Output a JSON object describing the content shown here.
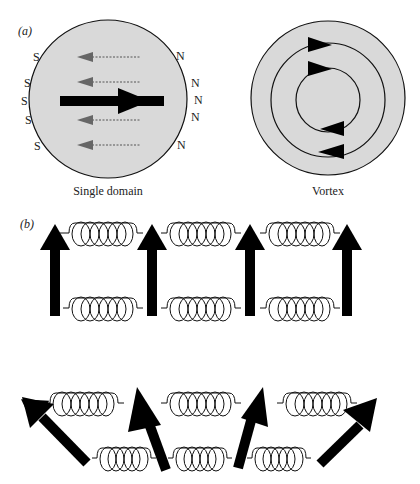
{
  "panel_a": {
    "label": "(a)",
    "single_domain": {
      "caption": "Single domain",
      "south_labels": [
        "S",
        "S",
        "S",
        "S",
        "S"
      ],
      "north_labels": [
        "N",
        "N",
        "N",
        "N",
        "N"
      ],
      "fill_color": "#d9d9d9",
      "stray_field_color": "#666666"
    },
    "vortex": {
      "caption": "Vortex",
      "fill_color": "#d9d9d9"
    }
  },
  "panel_b": {
    "label": "(b)",
    "top_configuration": "aligned moments coupled by springs",
    "bottom_configuration": "canted moments coupled by springs"
  },
  "colors": {
    "arrow": "#000000",
    "line": "#111111",
    "background": "#ffffff"
  }
}
